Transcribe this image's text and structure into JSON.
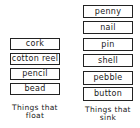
{
  "float_column": {
    "items": [
      "cork",
      "cotton reel",
      "pencil",
      "bead"
    ],
    "caption_line1": "Things that",
    "caption_line2": "float"
  },
  "sink_column": {
    "items": [
      "penny",
      "nail",
      "pin",
      "shell",
      "pebble",
      "button"
    ],
    "caption_line1": "Things that",
    "caption_line2": "sink"
  }
}
